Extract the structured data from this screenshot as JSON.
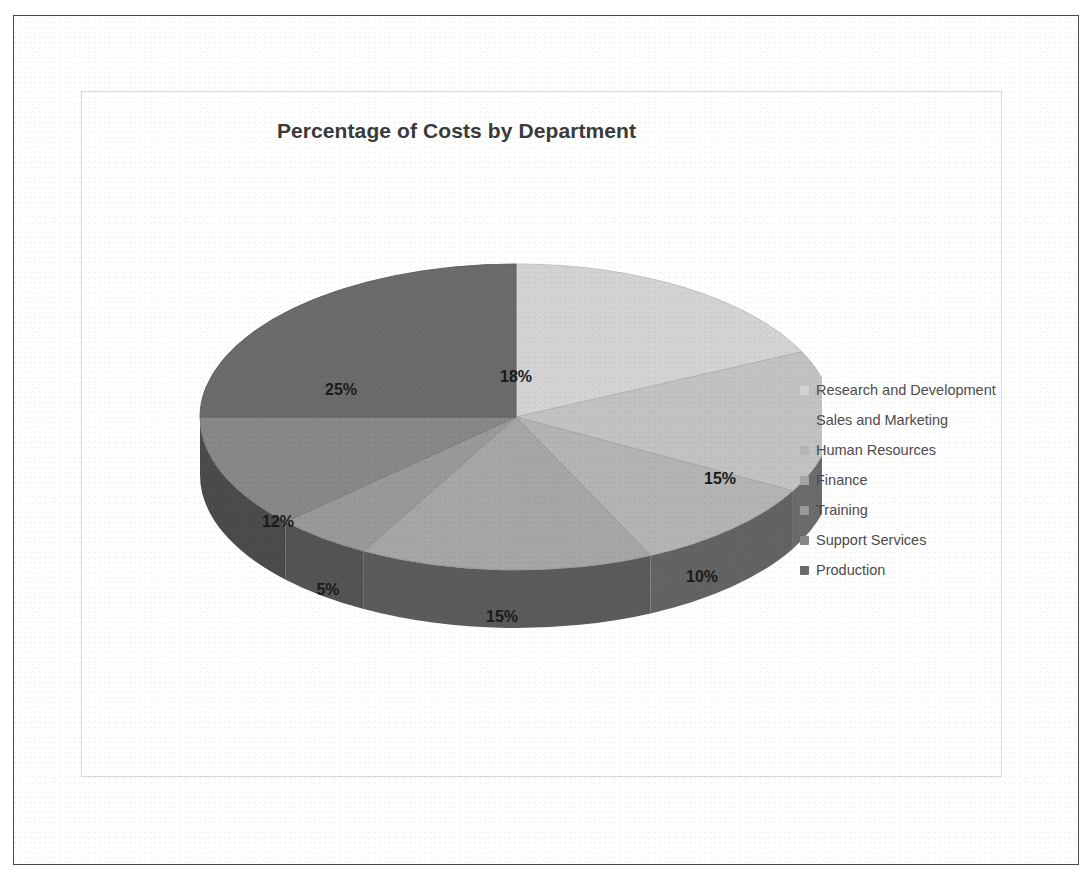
{
  "chart": {
    "title": "Percentage of Costs by Department"
  },
  "legend": {
    "position": "right",
    "items": [
      {
        "label": "Research and Development",
        "color": "#d3d3d3"
      },
      {
        "label": "Sales and Marketing",
        "color": "#c2c2c2"
      },
      {
        "label": "Human Resources",
        "color": "#b4b4b4"
      },
      {
        "label": "Finance",
        "color": "#a6a6a6"
      },
      {
        "label": "Training",
        "color": "#999999"
      },
      {
        "label": "Support Services",
        "color": "#888888"
      },
      {
        "label": "Production",
        "color": "#6b6b6b"
      }
    ]
  },
  "chart_data": {
    "type": "pie",
    "title": "Percentage of Costs by Department",
    "xlabel": "",
    "ylabel": "",
    "categories": [
      "Research and Development",
      "Sales and Marketing",
      "Human Resources",
      "Finance",
      "Training",
      "Support Services",
      "Production"
    ],
    "values": [
      18,
      15,
      10,
      15,
      5,
      12,
      25
    ],
    "data_labels": [
      "18%",
      "15%",
      "10%",
      "15%",
      "5%",
      "12%",
      "25%"
    ],
    "colors": [
      "#d3d3d3",
      "#c2c2c2",
      "#b4b4b4",
      "#a6a6a6",
      "#999999",
      "#888888",
      "#6b6b6b"
    ],
    "units": "percent",
    "total": 100,
    "start_angle_deg": 0,
    "direction": "clockwise",
    "three_d": true,
    "legend_position": "right",
    "grid": false
  },
  "slice_labels": [
    {
      "text": "18%",
      "x": 434,
      "y": 290
    },
    {
      "text": "15%",
      "x": 638,
      "y": 392
    },
    {
      "text": "10%",
      "x": 620,
      "y": 490
    },
    {
      "text": "15%",
      "x": 420,
      "y": 530
    },
    {
      "text": "5%",
      "x": 246,
      "y": 503
    },
    {
      "text": "12%",
      "x": 196,
      "y": 435
    },
    {
      "text": "25%",
      "x": 259,
      "y": 303
    }
  ],
  "style": {
    "page_background": "#ffffff",
    "frame_border": "#4a4a4a",
    "chart_border": "#d9d9d9",
    "title_color": "#3a3a3a",
    "label_color": "#1a1a1a",
    "legend_text_color": "#4c4c4c",
    "pie_wall_color": "#4a4a4a"
  }
}
